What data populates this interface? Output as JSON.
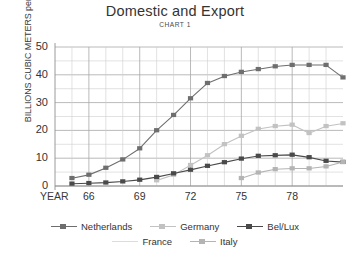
{
  "chart_data": {
    "type": "line",
    "title": "Domestic and Export",
    "subtitle": "CHART 1",
    "xlabel": "YEAR",
    "ylabel": "BILLIONS CUBIC METERS per YEAR",
    "ylim": [
      0,
      50
    ],
    "yticks": [
      0,
      10,
      20,
      30,
      40,
      50
    ],
    "xlim": [
      1964,
      1981
    ],
    "xticks_major": [
      "66",
      "69",
      "72",
      "75",
      "78"
    ],
    "xtick_major_values": [
      1966,
      1969,
      1972,
      1975,
      1978
    ],
    "grid": true,
    "legend_position": "bottom",
    "x": [
      1964,
      1965,
      1966,
      1967,
      1968,
      1969,
      1970,
      1971,
      1972,
      1973,
      1974,
      1975,
      1976,
      1977,
      1978,
      1979,
      1980,
      1981
    ],
    "series": [
      {
        "name": "Netherlands",
        "color": "#6e6e6e",
        "marker": "square-filled",
        "values": [
          null,
          2.8,
          4.0,
          6.5,
          9.5,
          13.5,
          20.0,
          25.5,
          31.5,
          37.0,
          39.5,
          41.0,
          42.0,
          43.0,
          43.5,
          43.5,
          43.5,
          39.0
        ]
      },
      {
        "name": "Germany",
        "color": "#c2c2c2",
        "marker": "square-light",
        "values": [
          null,
          null,
          null,
          null,
          null,
          null,
          2.0,
          4.0,
          7.5,
          11.0,
          15.0,
          18.0,
          20.5,
          21.5,
          22.0,
          19.0,
          21.5,
          22.5
        ]
      },
      {
        "name": "Bel/Lux",
        "color": "#4a4a4a",
        "marker": "square-dark",
        "values": [
          null,
          0.8,
          1.0,
          1.2,
          1.6,
          2.2,
          3.2,
          4.5,
          5.8,
          7.2,
          8.5,
          9.8,
          10.8,
          11.0,
          11.2,
          10.3,
          9.0,
          8.6
        ]
      },
      {
        "name": "France",
        "color": "#dcdcdc",
        "marker": "line-faint",
        "values": [
          null,
          null,
          null,
          null,
          null,
          null,
          null,
          null,
          null,
          null,
          null,
          null,
          null,
          null,
          null,
          null,
          null,
          null
        ]
      },
      {
        "name": "Italy",
        "color": "#b4b4b4",
        "marker": "square-mid",
        "values": [
          null,
          null,
          null,
          null,
          null,
          null,
          null,
          null,
          null,
          null,
          null,
          2.8,
          4.8,
          6.0,
          6.3,
          6.3,
          7.0,
          8.6
        ]
      }
    ]
  },
  "legend": {
    "row1": [
      {
        "label": "Netherlands"
      },
      {
        "label": "Germany"
      },
      {
        "label": "Bel/Lux"
      }
    ],
    "row2": [
      {
        "label": "France"
      },
      {
        "label": "Italy"
      }
    ]
  }
}
